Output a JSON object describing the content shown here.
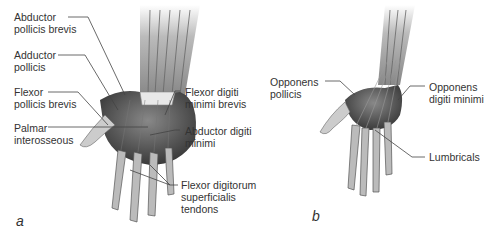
{
  "figure": {
    "panel_a": {
      "letter": "a",
      "labels": [
        {
          "id": "abductor-pollicis-brevis",
          "text": "Abductor\npollicis brevis"
        },
        {
          "id": "adductor-pollicis",
          "text": "Adductor\npollicis"
        },
        {
          "id": "flexor-pollicis-brevis",
          "text": "Flexor\npollicis brevis"
        },
        {
          "id": "palmar-interosseous",
          "text": "Palmar\ninterosseous"
        },
        {
          "id": "flexor-digiti-minimi-brevis",
          "text": "Flexor digiti\nminimi brevis"
        },
        {
          "id": "abductor-digiti-minimi",
          "text": "Abductor digiti\nminimi"
        },
        {
          "id": "flexor-digitorum-superficialis-tendons",
          "text": "Flexor digitorum\nsuperficialis\ntendons"
        }
      ]
    },
    "panel_b": {
      "letter": "b",
      "labels": [
        {
          "id": "opponens-pollicis",
          "text": "Opponens\npollicis"
        },
        {
          "id": "opponens-digiti-minimi",
          "text": "Opponens\ndigiti minimi"
        },
        {
          "id": "lumbricals",
          "text": "Lumbricals"
        }
      ]
    }
  }
}
